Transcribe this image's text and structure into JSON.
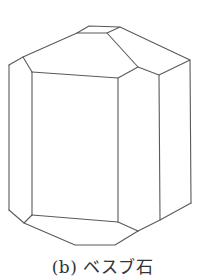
{
  "figure": {
    "caption_label": "(b)",
    "caption_text": "ベスブ石",
    "line_color": "#5a5a5a"
  }
}
